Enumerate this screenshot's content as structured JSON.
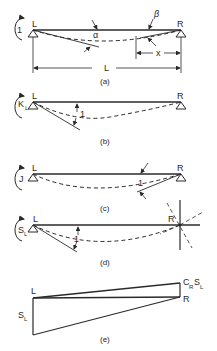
{
  "figure": {
    "panels": [
      {
        "id": "a",
        "caption": "(a)",
        "moment_label": "1",
        "left_label": "L",
        "right_label": "R",
        "angle_left": "α",
        "angle_right": "β",
        "distance_label": "x",
        "span_label": "L"
      },
      {
        "id": "b",
        "caption": "(b)",
        "moment_label": "K",
        "moment_sub": "L",
        "left_label": "L",
        "right_label": "R",
        "angle_label": "1"
      },
      {
        "id": "c",
        "caption": "(c)",
        "moment_label": "J",
        "left_label": "L",
        "right_label": "R",
        "angle_label": "1"
      },
      {
        "id": "d",
        "caption": "(d)",
        "moment_label": "S",
        "moment_sub": "L",
        "left_label": "L",
        "right_label": "R",
        "angle_label": "1"
      },
      {
        "id": "e",
        "caption": "(e)",
        "left_label": "L",
        "right_label": "R",
        "left_value": "S",
        "left_value_sub": "L",
        "right_value_c": "C",
        "right_value_c_sub": "R",
        "right_value_s": "S",
        "right_value_s_sub": "L"
      }
    ]
  }
}
